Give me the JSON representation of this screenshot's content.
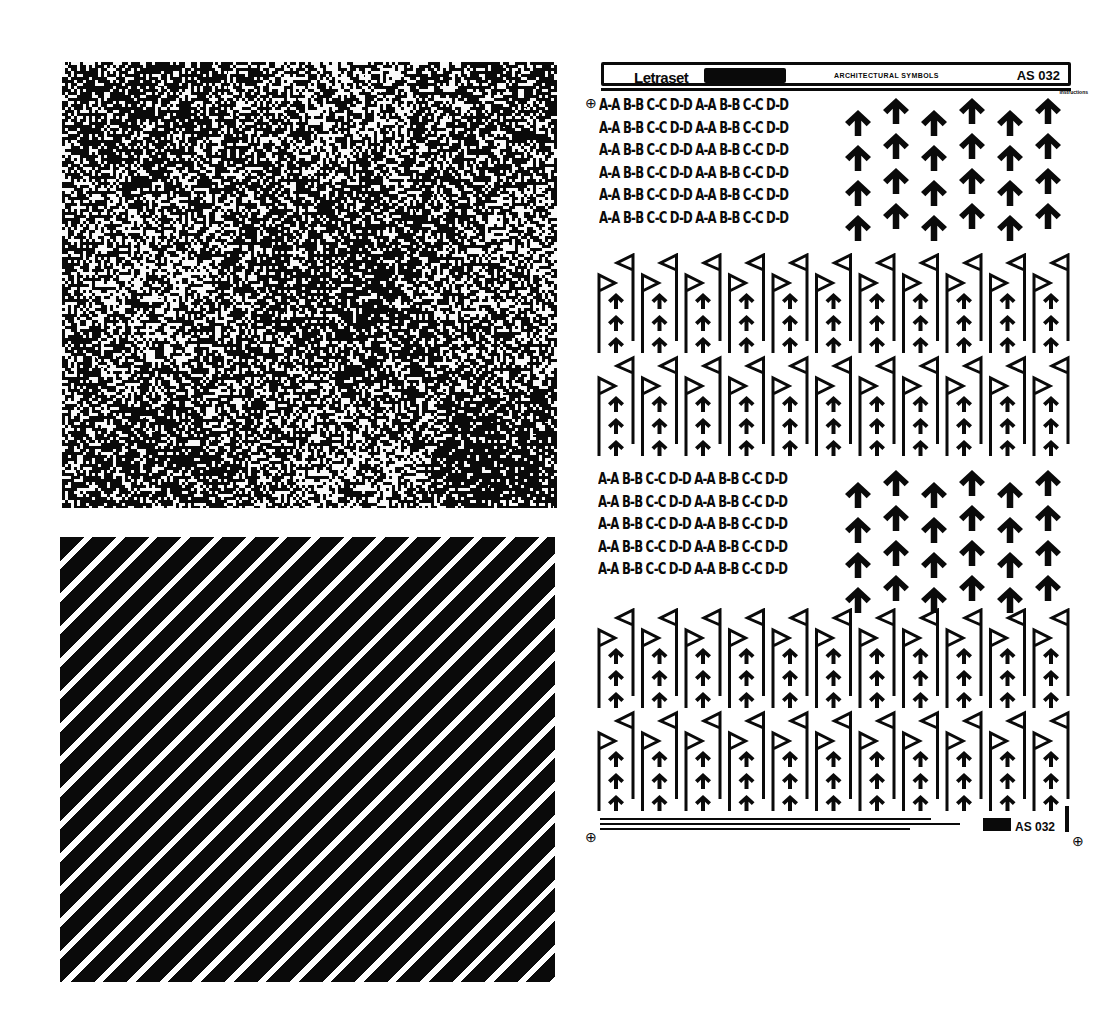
{
  "sheet": {
    "brand": "Letraset",
    "title": "ARCHITECTURAL SYMBOLS",
    "code": "AS 032",
    "subtitle": "instructions",
    "footer_code": "AS 032",
    "section_labels": [
      "A-A",
      "B-B",
      "C-C",
      "D-D",
      "A-A",
      "B-B",
      "C-C",
      "D-D"
    ],
    "registration_mark": "⊕"
  },
  "panels": {
    "noise": {
      "pattern": "random-dot-texture",
      "fg": "#0a0a0a",
      "bg": "#ffffff"
    },
    "stripes": {
      "pattern": "diagonal-hatch",
      "angle_deg": 45,
      "fg": "#0a0a0a",
      "bg": "#ffffff"
    }
  }
}
